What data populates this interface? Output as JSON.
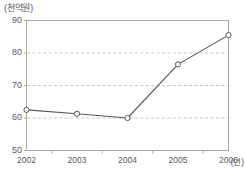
{
  "chart_data": {
    "type": "line",
    "title": "",
    "subtitle": "",
    "unit_label": "(천억원)",
    "xlabel": "(년)",
    "ylabel": "",
    "categories": [
      "2002",
      "2003",
      "2004",
      "2005",
      "2006"
    ],
    "x": [
      2002,
      2003,
      2004,
      2005,
      2006
    ],
    "values": [
      62.5,
      61.3,
      60.0,
      76.5,
      85.5
    ],
    "series": [
      {
        "name": "",
        "values": [
          62.5,
          61.3,
          60.0,
          76.5,
          85.5
        ]
      }
    ],
    "ylim": [
      50,
      90
    ],
    "yticks": [
      50,
      60,
      70,
      80,
      90
    ],
    "ytick_labels": [
      "50",
      "60",
      "70",
      "80",
      "90"
    ],
    "xtick_labels": [
      "2002",
      "2003",
      "2004",
      "2005",
      "2006"
    ],
    "grid": true,
    "grid_axis": "y",
    "grid_style": "dashed",
    "legend": false,
    "legend_position": "none",
    "marker": "open-circle",
    "colors": {
      "line": "#555555",
      "marker_fill": "#ffffff",
      "marker_edge": "#555555",
      "grid": "#b8b8b8",
      "frame": "#a8a8a8",
      "text": "#5a5a5a",
      "background": "#ffffff"
    },
    "annotations": []
  },
  "axes": {
    "y": {
      "ticks": [
        {
          "label": "90",
          "value": 90
        },
        {
          "label": "80",
          "value": 80
        },
        {
          "label": "70",
          "value": 70
        },
        {
          "label": "60",
          "value": 60
        },
        {
          "label": "50",
          "value": 50
        }
      ]
    },
    "x": {
      "ticks": [
        {
          "label": "2002",
          "value": 2002
        },
        {
          "label": "2003",
          "value": 2003
        },
        {
          "label": "2004",
          "value": 2004
        },
        {
          "label": "2005",
          "value": 2005
        },
        {
          "label": "2006",
          "value": 2006
        }
      ],
      "name": "(년)"
    }
  }
}
